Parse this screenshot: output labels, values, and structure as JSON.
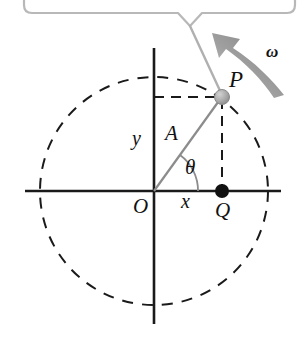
{
  "figure": {
    "type": "physics-diagram",
    "width": 302,
    "height": 346,
    "background_color": "#ffffff"
  },
  "callout": {
    "text": "",
    "border_color": "#b3b3b3",
    "fill_color": "#ffffff",
    "leader_target": "P",
    "box": {
      "x": 24,
      "y": -34,
      "width": 271,
      "height": 48,
      "corner_radius": 8
    },
    "tail": {
      "left_x": 178,
      "notch_x": 190,
      "right_x": 202,
      "y": 13,
      "tip_x": 222,
      "tip_y": 95
    }
  },
  "labels": {
    "point_p": "P",
    "point_q": "Q",
    "origin": "O",
    "radius": "A",
    "angle": "θ",
    "x_projection": "x",
    "y_projection": "y",
    "angular_velocity": "ω"
  },
  "geometry": {
    "center": {
      "x": 154,
      "y": 191
    },
    "radius": 114,
    "point_p": {
      "x": 222,
      "y": 97
    },
    "point_q": {
      "x": 222,
      "y": 191
    },
    "angle_degrees": 54,
    "x_axis": {
      "x1": 25,
      "x2": 281,
      "y": 191
    },
    "y_axis": {
      "x": 154,
      "y1": 48,
      "y2": 324
    },
    "dashed_horizontal": {
      "x1": 154,
      "x2": 222,
      "y": 97
    },
    "dashed_vertical": {
      "x": 222,
      "y1": 97,
      "y2": 191
    },
    "angle_arc_radius": 44
  },
  "colors": {
    "axis": "#1a1a1a",
    "circle_dashed": "#1a1a1a",
    "radius_line": "#8c8c8c",
    "point_p_fill": "#a8a8a8",
    "point_p_stroke": "#8a8a8a",
    "point_q_fill": "#111111",
    "arrow": "#8f8f8f",
    "callout_border": "#b8b8b8",
    "label_text": "#111111"
  },
  "arrow": {
    "name": "angular-velocity-arrow",
    "direction": "counterclockwise",
    "from": {
      "x": 282,
      "y": 92
    },
    "to": {
      "x": 220,
      "y": 40
    }
  }
}
